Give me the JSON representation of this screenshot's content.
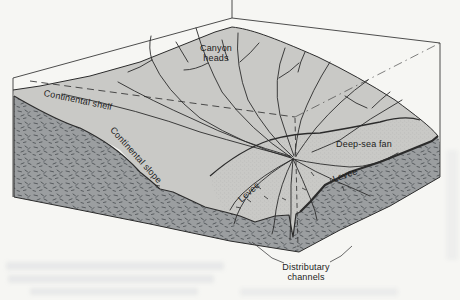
{
  "labels": {
    "canyon_heads_line1": "Canyon",
    "canyon_heads_line2": "heads",
    "continental_shelf": "Continental shelf",
    "continental_slope": "Continental slope",
    "deep_sea_fan": "Deep-sea fan",
    "levee_left": "Levee",
    "levee_right": "Levee",
    "distributary_line1": "Distributary",
    "distributary_line2": "channels"
  },
  "colors": {
    "background": "#f6f6f3",
    "land_surface": "#c9c9c6",
    "cut_face": "#9b9ea0",
    "line": "#2b2b2b"
  }
}
